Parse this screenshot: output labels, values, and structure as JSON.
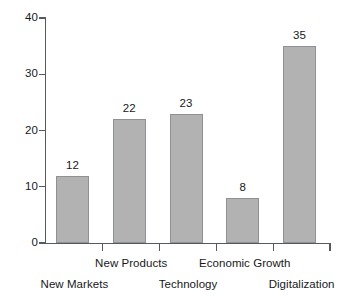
{
  "chart_data": {
    "type": "bar",
    "title": "",
    "subtitle": "",
    "xlabel": "",
    "ylabel": "",
    "categories": [
      "New Markets",
      "New Products",
      "Technology",
      "Economic Growth",
      "Digitalization"
    ],
    "values": [
      12,
      22,
      23,
      8,
      35
    ],
    "value_labels": [
      "12",
      "22",
      "23",
      "8",
      "35"
    ],
    "ylim": [
      0,
      40
    ],
    "yticks": [
      0,
      10,
      20,
      30,
      40
    ],
    "ytick_labels": [
      "0",
      "10",
      "20",
      "30",
      "40"
    ],
    "grid": false,
    "legend": false,
    "legend_position": "none",
    "annotations": [],
    "colors": {
      "bar_fill": "#b2b2b2",
      "bar_border": "#8f9295",
      "axis": "#555a5e",
      "text": "#17191b",
      "background": "#ffffff"
    },
    "label_rows": [
      1,
      0,
      1,
      0,
      1
    ]
  }
}
